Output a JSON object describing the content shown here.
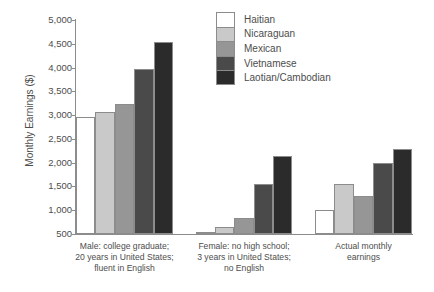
{
  "chart_data": {
    "type": "bar",
    "title": "",
    "xlabel": "",
    "ylabel": "Monthly Earnings ($)",
    "ylim": [
      500,
      5000
    ],
    "ytick_values": [
      500,
      1000,
      1500,
      2000,
      2500,
      3000,
      3500,
      4000,
      4500,
      5000
    ],
    "ytick_labels": [
      "500",
      "1,000",
      "1,500",
      "2,000",
      "2,500",
      "3,000",
      "3,500",
      "4,000",
      "4,500",
      "5,000"
    ],
    "grid": false,
    "legend_position": "top-right",
    "categories": [
      "Male: college graduate; 20 years in United States; fluent in English",
      "Female: no high school; 3 years in United States; no English",
      "Actual monthly earnings"
    ],
    "category_lines": [
      [
        "Male: college graduate;",
        "20 years in United States;",
        "fluent in English"
      ],
      [
        "Female: no high school;",
        "3 years in United States;",
        "no English"
      ],
      [
        "Actual monthly",
        "earnings"
      ]
    ],
    "series": [
      {
        "name": "Haitian",
        "color": "#ffffff",
        "values": [
          2960,
          540,
          1000
        ]
      },
      {
        "name": "Nicaraguan",
        "color": "#c9c9c9",
        "values": [
          3060,
          640,
          1560
        ]
      },
      {
        "name": "Mexican",
        "color": "#969696",
        "values": [
          3230,
          830,
          1290
        ]
      },
      {
        "name": "Vietnamese",
        "color": "#4a4a4a",
        "values": [
          3960,
          1560,
          2000
        ]
      },
      {
        "name": "Laotian/Cambodian",
        "color": "#2b2b2b",
        "values": [
          4540,
          2140,
          2290
        ]
      }
    ]
  },
  "legend": {
    "items": [
      {
        "label": "Haitian"
      },
      {
        "label": "Nicaraguan"
      },
      {
        "label": "Mexican"
      },
      {
        "label": "Vietnamese"
      },
      {
        "label": "Laotian/Cambodian"
      }
    ]
  }
}
